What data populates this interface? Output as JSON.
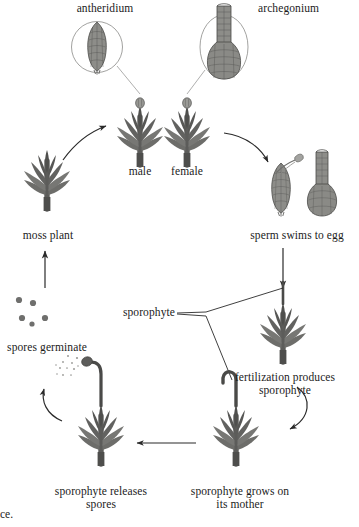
{
  "figure": {
    "background_color": "#ffffff",
    "ink_color": "#1b1b1b",
    "plant_fill_dark": "#5e5e5c",
    "plant_fill_mid": "#767674",
    "plant_fill_light": "#8d8d8a",
    "organ_fill": "#8a8a86",
    "organ_stroke": "#4a4a48",
    "spore_color": "#6f6f6d"
  },
  "labels": {
    "antheridium": "antheridium",
    "archegonium": "archegonium",
    "male": "male",
    "female": "female",
    "moss_plant": "moss plant",
    "sperm_swims_to_egg": "sperm swims to egg",
    "sporophyte": "sporophyte",
    "spores_germinate": "spores germinate",
    "fertilization_produces_line1": "fertilization produces",
    "fertilization_produces_line2": "sporophyte",
    "sporophyte_releases_line1": "sporophyte releases",
    "sporophyte_releases_line2": "spores",
    "sporophyte_grows_line1": "sporophyte grows on",
    "sporophyte_grows_line2": "its mother",
    "cut_caption_fragment": "ce."
  },
  "stages": [
    {
      "id": "moss-plant",
      "label": "moss plant",
      "description": "mature leafy gametophyte",
      "x": 47,
      "y": 185
    },
    {
      "id": "male-gametophyte",
      "label": "male",
      "description": "gametophyte bearing antheridium",
      "x": 140,
      "y": 140
    },
    {
      "id": "female-gametophyte",
      "label": "female",
      "description": "gametophyte bearing archegonium",
      "x": 187,
      "y": 140
    },
    {
      "id": "sperm-swims-to-egg",
      "label": "sperm swims to egg",
      "description": "sperm released from antheridium swims to archegonium",
      "x": 300,
      "y": 185
    },
    {
      "id": "fertilization-produces-sporophyte",
      "label": "fertilization produces sporophyte",
      "description": "zygote develops into sporophyte on the gametophyte",
      "x": 290,
      "y": 340
    },
    {
      "id": "sporophyte-grows-on-its-mother",
      "label": "sporophyte grows on its mother",
      "description": "young hooked sporophyte attached to female gametophyte",
      "x": 240,
      "y": 440
    },
    {
      "id": "sporophyte-releases-spores",
      "label": "sporophyte releases spores",
      "description": "mature capsule sheds spores",
      "x": 105,
      "y": 440
    },
    {
      "id": "spores-germinate",
      "label": "spores germinate",
      "description": "spores germinate to form new gametophyte",
      "x": 45,
      "y": 325
    }
  ],
  "callouts": [
    {
      "id": "antheridium-callout",
      "label": "antheridium",
      "shape": "circle",
      "organ": "elongate sac of sperm-producing cells"
    },
    {
      "id": "archegonium-callout",
      "label": "archegonium",
      "shape": "ellipse",
      "organ": "flask-shaped organ with long neck and egg at base"
    }
  ],
  "arrows": [
    {
      "id": "moss-to-male",
      "style": "curved",
      "from": "moss plant",
      "to": "male gametophyte"
    },
    {
      "id": "female-to-sperm",
      "style": "curved",
      "from": "female gametophyte",
      "to": "sperm swims to egg"
    },
    {
      "id": "sperm-to-fertilization",
      "style": "straight-down",
      "from": "sperm swims to egg",
      "to": "fertilization produces sporophyte"
    },
    {
      "id": "fertilization-to-grows",
      "style": "curved",
      "from": "fertilization produces sporophyte",
      "to": "sporophyte grows on its mother"
    },
    {
      "id": "grows-to-releases",
      "style": "straight-left",
      "from": "sporophyte grows on its mother",
      "to": "sporophyte releases spores"
    },
    {
      "id": "releases-to-spores",
      "style": "curved",
      "from": "sporophyte releases spores",
      "to": "spores germinate"
    },
    {
      "id": "spores-to-moss",
      "style": "straight-up",
      "from": "spores germinate",
      "to": "moss plant"
    }
  ],
  "leader_lines": [
    {
      "id": "antheridium-leader",
      "from": "antheridium callout",
      "to": "male gametophyte tip"
    },
    {
      "id": "archegonium-leader",
      "from": "archegonium callout",
      "to": "female gametophyte tip"
    },
    {
      "id": "sporophyte-leader-upper",
      "from": "sporophyte label",
      "to": "mature sporophyte stalk"
    },
    {
      "id": "sporophyte-leader-lower",
      "from": "sporophyte label",
      "to": "young hooked sporophyte"
    }
  ],
  "spore_dots": {
    "count": 5,
    "positions": [
      [
        18,
        300
      ],
      [
        32,
        303
      ],
      [
        22,
        318
      ],
      [
        32,
        323
      ],
      [
        45,
        318
      ]
    ]
  }
}
